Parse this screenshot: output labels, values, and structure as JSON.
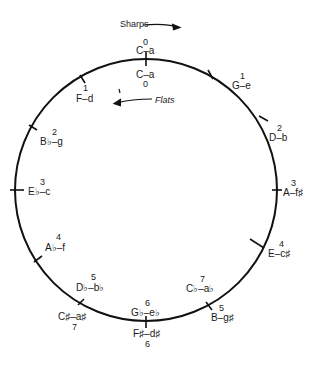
{
  "arrows": {
    "sharps": "Sharps",
    "flats": "Flats"
  },
  "top": {
    "outer": {
      "keys": "C–a",
      "count": "0"
    },
    "inner": {
      "keys": "C–a",
      "count": "0"
    }
  },
  "sharp_keys": [
    {
      "keys": "G–e",
      "count": "1"
    },
    {
      "keys": "D–b",
      "count": "2"
    },
    {
      "keys": "A–f♯",
      "count": "3"
    },
    {
      "keys": "E–c♯",
      "count": "4"
    },
    {
      "keys": "B–g♯",
      "count": "5"
    },
    {
      "keys": "F♯–d♯",
      "count": "6"
    },
    {
      "keys": "C♯–a♯",
      "count": "7"
    }
  ],
  "flat_keys": [
    {
      "keys": "F–d",
      "count": "1"
    },
    {
      "keys": "B♭–g",
      "count": "2"
    },
    {
      "keys": "E♭–c",
      "count": "3"
    },
    {
      "keys": "A♭–f",
      "count": "4"
    },
    {
      "keys": "D♭–b♭",
      "count": "5"
    },
    {
      "keys": "G♭–e♭",
      "count": "6"
    },
    {
      "keys": "C♭–a♭",
      "count": "7"
    }
  ]
}
